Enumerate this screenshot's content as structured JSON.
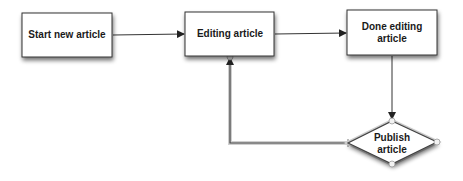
{
  "diagram": {
    "nodes": [
      {
        "id": "start",
        "shape": "rectangle",
        "lines": [
          "Start new article"
        ]
      },
      {
        "id": "editing",
        "shape": "rectangle",
        "lines": [
          "Editing article"
        ]
      },
      {
        "id": "done",
        "shape": "rectangle",
        "lines": [
          "Done editing",
          "article"
        ]
      },
      {
        "id": "publish",
        "shape": "diamond",
        "lines": [
          "Publish",
          "article"
        ],
        "selected": true
      }
    ],
    "edges": [
      {
        "from": "start",
        "to": "editing"
      },
      {
        "from": "editing",
        "to": "done"
      },
      {
        "from": "done",
        "to": "publish"
      },
      {
        "from": "publish",
        "to": "editing",
        "selected": true
      }
    ],
    "colors": {
      "node_fill": "#ffffff",
      "node_stroke": "#333333",
      "edge": "#333333",
      "selection_halo": "#bdbdbd"
    }
  }
}
